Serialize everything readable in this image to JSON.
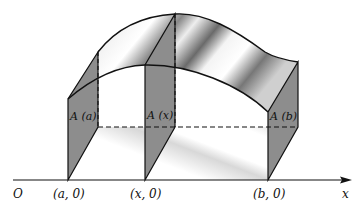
{
  "figure": {
    "colors": {
      "line": "#111111",
      "panel_fill": "#8a8a8a",
      "surface_light": "#f2f2f2",
      "surface_dark": "#6e6e6e",
      "background": "#ffffff"
    }
  },
  "axis": {
    "origin_label": "O",
    "axis_label": "x"
  },
  "points": [
    {
      "label": "(a, 0)"
    },
    {
      "label": "(x, 0)"
    },
    {
      "label": "(b, 0)"
    }
  ],
  "sections": [
    {
      "label": "A (a)"
    },
    {
      "label": "A (x)"
    },
    {
      "label": "A (b)"
    }
  ]
}
